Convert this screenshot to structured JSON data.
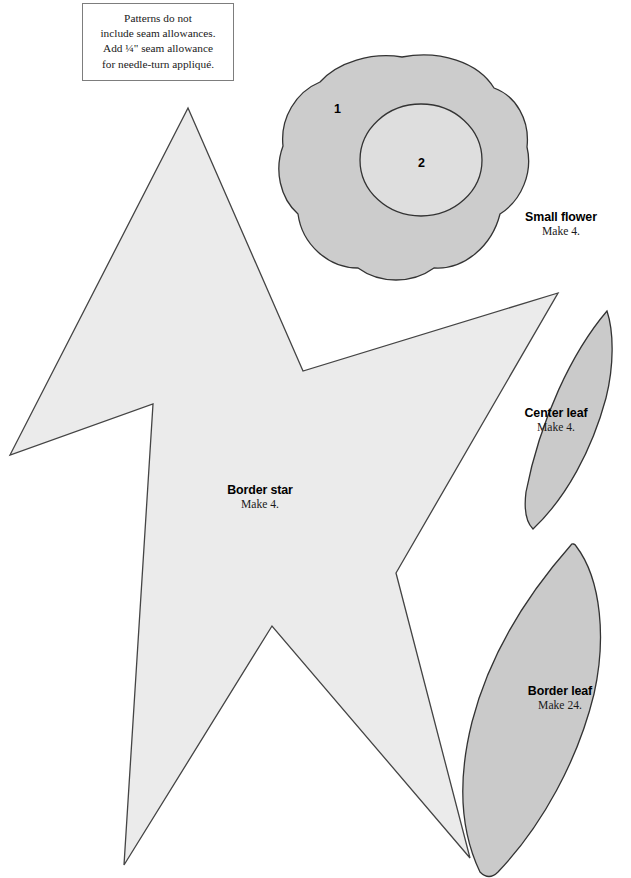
{
  "page": {
    "width": 631,
    "height": 878,
    "background": "#ffffff",
    "document_type": "quilt-applique-pattern-sheet"
  },
  "note": {
    "name": "seam-allowance-note",
    "lines": [
      "Patterns do not",
      "include seam allowances.",
      "Add ¼\" seam allowance",
      "for needle-turn appliqué."
    ]
  },
  "pieces": [
    {
      "id": "small-flower",
      "shape": "five-lobed-flower",
      "title": "Small flower",
      "quantity_label": "Make 4.",
      "fill": "#cccccc",
      "stroke": "#333333",
      "regions": [
        {
          "number": "1",
          "role": "outer-petal",
          "fill": "#cccccc"
        },
        {
          "number": "2",
          "role": "inner-circle",
          "fill": "#dedede"
        }
      ]
    },
    {
      "id": "border-star",
      "shape": "five-point-star",
      "title": "Border star",
      "quantity_label": "Make 4.",
      "fill": "#ebebeb",
      "stroke": "#444444"
    },
    {
      "id": "center-leaf",
      "shape": "lens-leaf",
      "title": "Center leaf",
      "quantity_label": "Make 4.",
      "fill": "#cacaca",
      "stroke": "#333333"
    },
    {
      "id": "border-leaf",
      "shape": "lens-leaf-large",
      "title": "Border leaf",
      "quantity_label": "Make 24.",
      "fill": "#cacaca",
      "stroke": "#333333"
    }
  ],
  "colors": {
    "paper": "#ffffff",
    "star_fill": "#ebebeb",
    "petal_fill": "#cccccc",
    "flower_center_fill": "#dedede",
    "leaf_fill": "#cacaca",
    "outline": "#333333",
    "note_border": "#7d7d7d",
    "text": "#000000"
  }
}
